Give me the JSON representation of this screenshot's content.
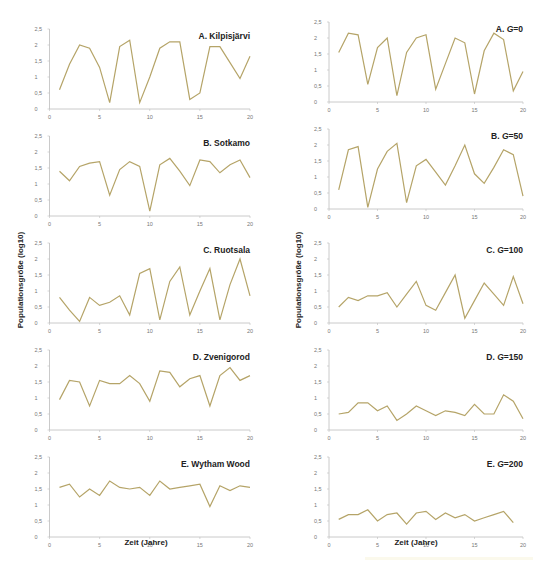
{
  "figure": {
    "ylabel": "Populationsgröße (log10)",
    "xlabel": "Zeit (Jahre)",
    "series_color": "#b5a468"
  },
  "chart_data": [
    {
      "type": "line",
      "title": "A. Kilpisjärvi",
      "column": "left",
      "xlabel": "Zeit (Jahre)",
      "ylabel": "Populationsgröße (log10)",
      "ylim": [
        0,
        2.5
      ],
      "xlim": [
        0,
        20
      ],
      "yticks": [
        "0",
        "0,5",
        "1",
        "1,5",
        "2",
        "2,5"
      ],
      "xticks": [
        "0",
        "5",
        "10",
        "15",
        "20"
      ],
      "grid": false,
      "x": [
        1,
        2,
        3,
        4,
        5,
        6,
        7,
        8,
        9,
        10,
        11,
        12,
        13,
        14,
        15,
        16,
        17,
        18,
        19,
        20
      ],
      "values": [
        0.6,
        1.4,
        2.0,
        1.9,
        1.3,
        0.2,
        1.95,
        2.15,
        0.2,
        1.0,
        1.9,
        2.1,
        2.1,
        0.3,
        0.5,
        1.95,
        1.95,
        1.45,
        0.95,
        1.65
      ]
    },
    {
      "type": "line",
      "title": "B. Sotkamo",
      "column": "left",
      "ylim": [
        0,
        2.5
      ],
      "xlim": [
        0,
        20
      ],
      "yticks": [
        "0",
        "0,5",
        "1",
        "1,5",
        "2",
        "2,5"
      ],
      "xticks": [
        "0",
        "5",
        "10",
        "15",
        "20"
      ],
      "x": [
        1,
        2,
        3,
        4,
        5,
        6,
        7,
        8,
        9,
        10,
        11,
        12,
        13,
        14,
        15,
        16,
        17,
        18,
        19,
        20
      ],
      "values": [
        1.4,
        1.1,
        1.55,
        1.65,
        1.7,
        0.65,
        1.45,
        1.7,
        1.55,
        0.15,
        1.6,
        1.8,
        1.4,
        0.95,
        1.75,
        1.7,
        1.35,
        1.6,
        1.75,
        1.2
      ]
    },
    {
      "type": "line",
      "title": "C. Ruotsala",
      "column": "left",
      "ylim": [
        0,
        2.5
      ],
      "xlim": [
        0,
        20
      ],
      "yticks": [
        "0",
        "0,5",
        "1",
        "1,5",
        "2",
        "2,5"
      ],
      "xticks": [
        "0",
        "5",
        "10",
        "15",
        "20"
      ],
      "x": [
        1,
        2,
        3,
        4,
        5,
        6,
        7,
        8,
        9,
        10,
        11,
        12,
        13,
        14,
        15,
        16,
        17,
        18,
        19,
        20
      ],
      "values": [
        0.8,
        0.4,
        0.05,
        0.8,
        0.55,
        0.65,
        0.85,
        0.25,
        1.55,
        1.7,
        0.1,
        1.3,
        1.75,
        0.25,
        1.0,
        1.7,
        0.1,
        1.2,
        2.0,
        0.85
      ]
    },
    {
      "type": "line",
      "title": "D. Zvenigorod",
      "column": "left",
      "ylim": [
        0,
        2.5
      ],
      "xlim": [
        0,
        20
      ],
      "yticks": [
        "0",
        "0,5",
        "1",
        "1,5",
        "2",
        "2,5"
      ],
      "xticks": [
        "0",
        "5",
        "10",
        "15",
        "20"
      ],
      "x": [
        1,
        2,
        3,
        4,
        5,
        6,
        7,
        8,
        9,
        10,
        11,
        12,
        13,
        14,
        15,
        16,
        17,
        18,
        19,
        20
      ],
      "values": [
        0.95,
        1.55,
        1.5,
        0.75,
        1.55,
        1.45,
        1.45,
        1.7,
        1.45,
        0.9,
        1.85,
        1.8,
        1.35,
        1.6,
        1.7,
        0.75,
        1.7,
        1.95,
        1.55,
        1.7
      ]
    },
    {
      "type": "line",
      "title": "E. Wytham Wood",
      "column": "left",
      "ylim": [
        0,
        2.5
      ],
      "xlim": [
        0,
        20
      ],
      "yticks": [
        "0",
        "0,5",
        "1",
        "1,5",
        "2",
        "2,5"
      ],
      "xticks": [
        "0",
        "5",
        "10",
        "15",
        "20"
      ],
      "x": [
        1,
        2,
        3,
        4,
        5,
        6,
        7,
        8,
        9,
        10,
        11,
        12,
        13,
        14,
        15,
        16,
        17,
        18,
        19,
        20
      ],
      "values": [
        1.55,
        1.65,
        1.25,
        1.5,
        1.3,
        1.75,
        1.55,
        1.5,
        1.55,
        1.3,
        1.75,
        1.5,
        1.55,
        1.6,
        1.65,
        0.95,
        1.6,
        1.45,
        1.6,
        1.55
      ]
    },
    {
      "type": "line",
      "title": "A. G=0",
      "title_prefix": "A. ",
      "title_var": "G",
      "title_suffix": "=0",
      "column": "right",
      "ylim": [
        0,
        2.5
      ],
      "xlim": [
        0,
        20
      ],
      "yticks": [
        "0",
        "0,5",
        "1",
        "1,5",
        "2",
        "2,5"
      ],
      "xticks": [
        "0",
        "5",
        "10",
        "15",
        "20"
      ],
      "x": [
        1,
        2,
        3,
        4,
        5,
        6,
        7,
        8,
        9,
        10,
        11,
        12,
        13,
        14,
        15,
        16,
        17,
        18,
        19,
        20
      ],
      "values": [
        1.55,
        2.15,
        2.1,
        0.55,
        1.7,
        2.0,
        0.2,
        1.55,
        2.0,
        2.1,
        0.4,
        1.2,
        2.0,
        1.85,
        0.25,
        1.6,
        2.15,
        1.95,
        0.35,
        0.95
      ]
    },
    {
      "type": "line",
      "title": "B. G=50",
      "title_prefix": "B. ",
      "title_var": "G",
      "title_suffix": "=50",
      "column": "right",
      "ylim": [
        0,
        2.5
      ],
      "xlim": [
        0,
        20
      ],
      "yticks": [
        "0",
        "0,5",
        "1",
        "1,5",
        "2",
        "2,5"
      ],
      "xticks": [
        "0",
        "5",
        "10",
        "15",
        "20"
      ],
      "x": [
        1,
        2,
        3,
        4,
        5,
        6,
        7,
        8,
        9,
        10,
        11,
        12,
        13,
        14,
        15,
        16,
        17,
        18,
        19,
        20
      ],
      "values": [
        0.6,
        1.85,
        1.95,
        0.05,
        1.25,
        1.8,
        2.05,
        0.2,
        1.35,
        1.55,
        1.15,
        0.75,
        1.35,
        2.0,
        1.1,
        0.8,
        1.3,
        1.85,
        1.7,
        0.4
      ]
    },
    {
      "type": "line",
      "title": "C. G=100",
      "title_prefix": "C. ",
      "title_var": "G",
      "title_suffix": "=100",
      "column": "right",
      "ylim": [
        0,
        2.5
      ],
      "xlim": [
        0,
        20
      ],
      "yticks": [
        "0",
        "0,5",
        "1",
        "1,5",
        "2",
        "2,5"
      ],
      "xticks": [
        "0",
        "5",
        "10",
        "15",
        "20"
      ],
      "x": [
        1,
        2,
        3,
        4,
        5,
        6,
        7,
        8,
        9,
        10,
        11,
        12,
        13,
        14,
        15,
        16,
        17,
        18,
        19,
        20
      ],
      "values": [
        0.5,
        0.8,
        0.7,
        0.85,
        0.85,
        0.95,
        0.5,
        0.9,
        1.3,
        0.55,
        0.4,
        0.95,
        1.5,
        0.15,
        0.7,
        1.25,
        0.9,
        0.55,
        1.45,
        0.6
      ]
    },
    {
      "type": "line",
      "title": "D. G=150",
      "title_prefix": "D. ",
      "title_var": "G",
      "title_suffix": "=150",
      "column": "right",
      "ylim": [
        0,
        2.5
      ],
      "xlim": [
        0,
        20
      ],
      "yticks": [
        "0",
        "0,5",
        "1",
        "1,5",
        "2",
        "2,5"
      ],
      "xticks": [
        "0",
        "5",
        "10",
        "15",
        "20"
      ],
      "x": [
        1,
        2,
        3,
        4,
        5,
        6,
        7,
        8,
        9,
        10,
        11,
        12,
        13,
        14,
        15,
        16,
        17,
        18,
        19,
        20
      ],
      "values": [
        0.5,
        0.55,
        0.85,
        0.85,
        0.6,
        0.75,
        0.3,
        0.5,
        0.75,
        0.6,
        0.45,
        0.6,
        0.55,
        0.45,
        0.8,
        0.5,
        0.5,
        1.1,
        0.9,
        0.35
      ]
    },
    {
      "type": "line",
      "title": "E. G=200",
      "title_prefix": "E. ",
      "title_var": "G",
      "title_suffix": "=200",
      "column": "right",
      "ylim": [
        0,
        2.5
      ],
      "xlim": [
        0,
        20
      ],
      "yticks": [
        "0",
        "0,5",
        "1",
        "1,5",
        "2",
        "2,5"
      ],
      "xticks": [
        "0",
        "5",
        "10",
        "15",
        "20"
      ],
      "x": [
        1,
        2,
        3,
        4,
        5,
        6,
        7,
        8,
        9,
        10,
        11,
        12,
        13,
        14,
        15,
        16,
        17,
        18,
        19
      ],
      "values": [
        0.55,
        0.7,
        0.7,
        0.85,
        0.5,
        0.7,
        0.75,
        0.4,
        0.75,
        0.8,
        0.55,
        0.75,
        0.6,
        0.7,
        0.5,
        0.6,
        0.7,
        0.8,
        0.45
      ]
    }
  ]
}
